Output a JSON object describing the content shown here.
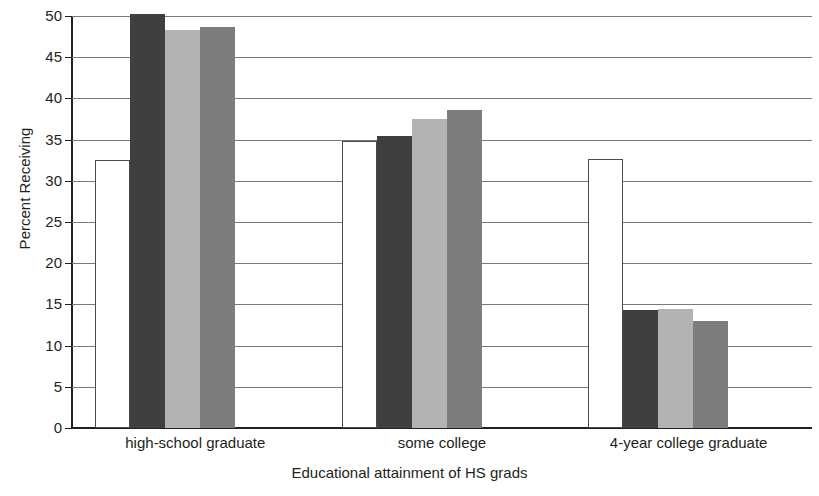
{
  "chart_data": {
    "type": "bar",
    "title": "",
    "xlabel": "Educational attainment of HS grads",
    "ylabel": "Percent Receiving",
    "ylim": [
      0,
      50
    ],
    "ytick_step": 5,
    "yticks": [
      "50",
      "45",
      "40",
      "35",
      "30",
      "25",
      "20",
      "15",
      "10",
      "5",
      "0"
    ],
    "grid": true,
    "legend": "none",
    "categories": [
      "high-school graduate",
      "some college",
      "4-year college graduate"
    ],
    "series": [
      {
        "name": "series-1",
        "color": "#ffffff",
        "values": [
          32.5,
          34.8,
          32.7
        ]
      },
      {
        "name": "series-2",
        "color": "#3f3f3f",
        "values": [
          50.3,
          35.4,
          14.3
        ]
      },
      {
        "name": "series-3",
        "color": "#b3b3b3",
        "values": [
          48.3,
          37.5,
          14.4
        ]
      },
      {
        "name": "series-4",
        "color": "#7d7d7d",
        "values": [
          48.7,
          38.6,
          13.0
        ]
      }
    ]
  }
}
